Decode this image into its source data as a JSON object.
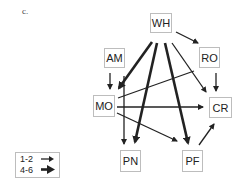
{
  "panel_label": "c.",
  "nodes": [
    {
      "id": "WH",
      "label": "WH",
      "x": 150,
      "y": 13,
      "w": 22,
      "h": 20
    },
    {
      "id": "AM",
      "label": "AM",
      "x": 104,
      "y": 48,
      "w": 21,
      "h": 20
    },
    {
      "id": "RO",
      "label": "RO",
      "x": 199,
      "y": 47,
      "w": 21,
      "h": 21
    },
    {
      "id": "MO",
      "label": "MO",
      "x": 93,
      "y": 95,
      "w": 22,
      "h": 22
    },
    {
      "id": "CR",
      "label": "CR",
      "x": 209,
      "y": 97,
      "w": 23,
      "h": 21
    },
    {
      "id": "PN",
      "label": "PN",
      "x": 120,
      "y": 150,
      "w": 21,
      "h": 22
    },
    {
      "id": "PF",
      "label": "PF",
      "x": 182,
      "y": 150,
      "w": 21,
      "h": 22
    }
  ],
  "edges": [
    {
      "from": "WH",
      "to": "RO",
      "weight": "1-2"
    },
    {
      "from": "WH",
      "to": "MO",
      "weight": "4-6"
    },
    {
      "from": "WH",
      "to": "PN",
      "weight": "4-6"
    },
    {
      "from": "WH",
      "to": "PF",
      "weight": "4-6"
    },
    {
      "from": "WH",
      "to": "CR",
      "weight": "1-2"
    },
    {
      "from": "AM",
      "to": "MO",
      "weight": "1-2"
    },
    {
      "from": "RO",
      "to": "CR",
      "weight": "1-2"
    },
    {
      "from": "MO",
      "to": "RO",
      "weight": "1-2"
    },
    {
      "from": "MO",
      "to": "CR",
      "weight": "1-2"
    },
    {
      "from": "MO",
      "to": "PN",
      "weight": "1-2"
    },
    {
      "from": "MO",
      "to": "PF",
      "weight": "1-2"
    },
    {
      "from": "PF",
      "to": "CR",
      "weight": "1-2"
    }
  ],
  "legend": {
    "items": [
      {
        "label": "1-2",
        "style": "thin-arrow"
      },
      {
        "label": "4-6",
        "style": "thick-arrow"
      }
    ]
  }
}
